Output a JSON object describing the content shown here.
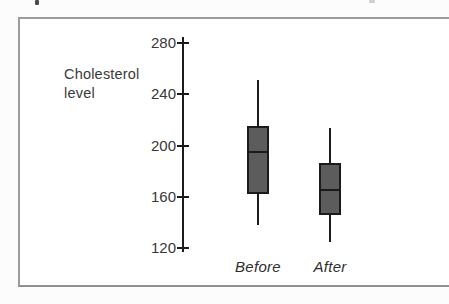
{
  "figure": {
    "ylabel_line1": "Cholesterol",
    "ylabel_line2": "level"
  },
  "chart_data": {
    "type": "box",
    "title": "",
    "ylabel": "Cholesterol level",
    "xlabel": "",
    "ylim": [
      120,
      280
    ],
    "yticks": [
      280,
      240,
      200,
      160,
      120
    ],
    "categories": [
      "Before",
      "After"
    ],
    "series": [
      {
        "name": "Before",
        "min": 138,
        "q1": 162,
        "median": 195,
        "q3": 215,
        "max": 251
      },
      {
        "name": "After",
        "min": 125,
        "q1": 146,
        "median": 165,
        "q3": 186,
        "max": 214
      }
    ],
    "grid": false,
    "legend": false
  },
  "colors": {
    "box_fill": "#5c5c5c",
    "box_border": "#1b1b1b",
    "axis": "#1b1b1b",
    "frame_border": "#9c9c9c",
    "label_text": "#3a3a3a"
  }
}
